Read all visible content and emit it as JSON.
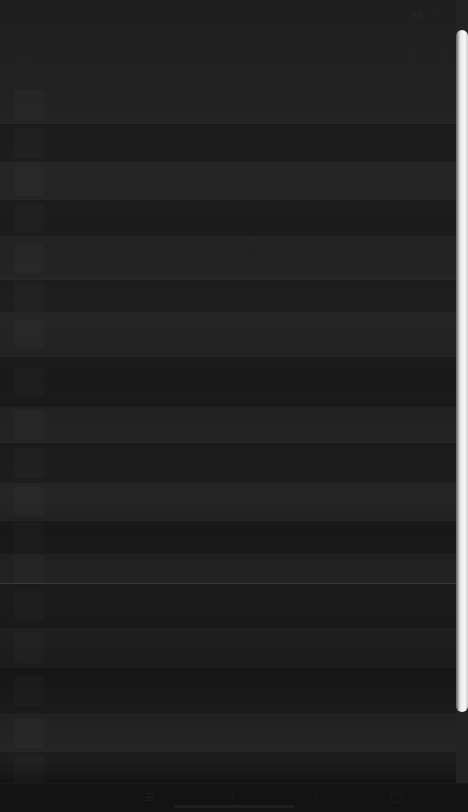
{
  "screen": {
    "width": 468,
    "height": 812,
    "appearance": "dark",
    "background_color": "#1b1b1c",
    "note_text": ""
  },
  "status_bar": {
    "time": "",
    "signal_icon": "signal-icon",
    "wifi_icon": "wifi-icon",
    "battery_icon": "battery-icon"
  },
  "app_bar": {
    "back_icon": "back-arrow-icon",
    "title": "",
    "search_icon": "search-icon",
    "menu_icon": "overflow-menu-icon"
  },
  "scrollbar": {
    "thumb_color": "#fbfbfb",
    "track_color": "#232324",
    "thumb_top": 30,
    "thumb_height": 682,
    "orientation": "vertical"
  },
  "content": {
    "rows": [
      {
        "title": "",
        "subtitle": "",
        "meta": "",
        "height": 40,
        "band": "light"
      },
      {
        "title": "",
        "subtitle": "",
        "meta": "",
        "height": 38,
        "band": "dark"
      },
      {
        "title": "",
        "subtitle": "",
        "meta": "",
        "height": 38,
        "band": "light"
      },
      {
        "title": "",
        "subtitle": "",
        "meta": "",
        "height": 36,
        "band": "dark"
      },
      {
        "title": "",
        "subtitle": "",
        "meta": "",
        "height": 44,
        "band": "light"
      },
      {
        "title": "",
        "subtitle": "",
        "meta": "",
        "height": 32,
        "band": "dark"
      },
      {
        "title": "",
        "subtitle": "",
        "meta": "",
        "height": 45,
        "band": "light"
      },
      {
        "title": "",
        "subtitle": "",
        "meta": "",
        "height": 50,
        "band": "dark"
      },
      {
        "title": "",
        "subtitle": "",
        "meta": "",
        "height": 36,
        "band": "light"
      },
      {
        "title": "",
        "subtitle": "",
        "meta": "",
        "height": 40,
        "band": "dark"
      },
      {
        "title": "",
        "subtitle": "",
        "meta": "",
        "height": 38,
        "band": "light"
      },
      {
        "title": "",
        "subtitle": "",
        "meta": "",
        "height": 33,
        "band": "dark"
      },
      {
        "title": "",
        "subtitle": "",
        "meta": "",
        "height": 30,
        "band": "light",
        "strong_divider": true
      },
      {
        "title": "",
        "subtitle": "",
        "meta": "",
        "height": 44,
        "band": "dark"
      },
      {
        "title": "",
        "subtitle": "",
        "meta": "",
        "height": 40,
        "band": "light"
      },
      {
        "title": "",
        "subtitle": "",
        "meta": "",
        "height": 46,
        "band": "dark"
      },
      {
        "title": "",
        "subtitle": "",
        "meta": "",
        "height": 38,
        "band": "light"
      },
      {
        "title": "",
        "subtitle": "",
        "meta": "",
        "height": 36,
        "band": "dark"
      },
      {
        "title": "",
        "subtitle": "",
        "meta": "",
        "height": 40,
        "band": "light"
      },
      {
        "title": "",
        "subtitle": "",
        "meta": "",
        "height": 45,
        "band": "dark"
      }
    ]
  },
  "bottom_bar": {
    "background_color": "#131314",
    "items": [
      {
        "icon": "home-icon",
        "label": ""
      },
      {
        "icon": "list-icon",
        "label": ""
      },
      {
        "icon": "plus-icon",
        "label": ""
      },
      {
        "icon": "bell-icon",
        "label": ""
      },
      {
        "icon": "profile-icon",
        "label": ""
      }
    ]
  }
}
